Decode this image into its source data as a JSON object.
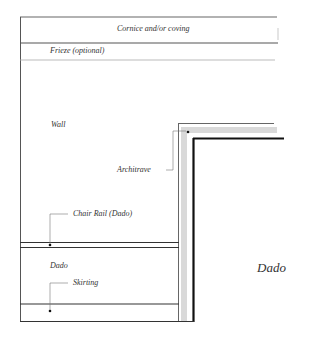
{
  "diagram": {
    "labels": {
      "cornice": "Cornice and/or coving",
      "frieze": "Frieze (optional)",
      "wall": "Wall",
      "architrave": "Architrave",
      "chair_rail": "Chair Rail (Dado)",
      "dado": "Dado",
      "skirting": "Skirting",
      "dado_large": "Dado"
    },
    "colors": {
      "line": "#444444",
      "frame_light": "#d9d9d9",
      "frame_dark": "#111111",
      "text": "#333333"
    }
  }
}
